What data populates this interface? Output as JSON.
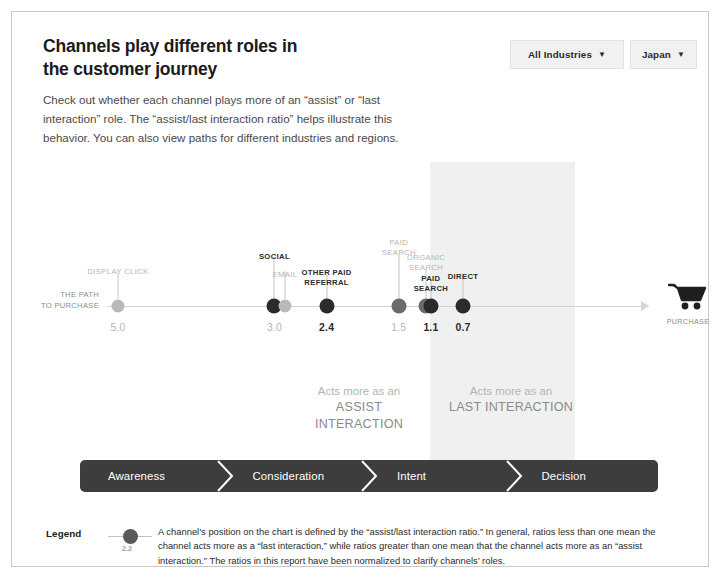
{
  "header": {
    "description": "Check out whether each channel plays more of an “assist” or “last interaction” role. The “assist/last interaction ratio” helps illustrate this behavior. You can also view paths for different industries and regions.",
    "filters": [
      {
        "name": "industry-filter",
        "label": "All Industries",
        "caret": "▼"
      },
      {
        "name": "region-filter",
        "label": "Japan",
        "caret": "▼"
      }
    ]
  },
  "axis": {
    "origin_label": "THE PATH\nTO PURCHASE",
    "end_icon": "shopping-cart-icon",
    "end_label": "PURCHASE"
  },
  "callouts": [
    {
      "name": "assist-callout",
      "line1": "Acts more as an",
      "line2": "ASSIST INTERACTION"
    },
    {
      "name": "last-callout",
      "line1": "Acts more as an",
      "line2": "LAST INTERACTION"
    }
  ],
  "funnel": {
    "stages": [
      {
        "label": "Awareness"
      },
      {
        "label": "Consideration"
      },
      {
        "label": "Intent"
      },
      {
        "label": "Decision"
      }
    ]
  },
  "legend": {
    "title": "Legend",
    "sample_value": "2.2",
    "text": "A channel’s position on the chart is defined by the “assist/last interaction ratio.” In general, ratios less than one mean the channel acts more as a “last interaction,” while ratios greater than one mean that the channel acts more as an “assist interaction.” The ratios in this report have been normalized to clarify channels’ roles."
  },
  "colors": {
    "band": "#f0f0f0",
    "funnel": "#3d3d3d",
    "axis": "#d4d4d4",
    "dot_dark": "#2b2b2b",
    "dot_mid": "#6b6b6b",
    "dot_light": "#b9b9b9"
  },
  "chart_data": {
    "type": "scatter",
    "xlabel": "assist/last interaction ratio",
    "ylabel": "",
    "xlim": [
      5.6,
      0.0
    ],
    "axis_direction": "decreasing left-to-right (path to purchase)",
    "grid": false,
    "legend_position": "bottom-left",
    "annotations": [
      "Acts more as an ASSIST INTERACTION",
      "Acts more as an LAST INTERACTION"
    ],
    "shaded_region": {
      "label": "LAST INTERACTION",
      "x_from": 1.3,
      "x_to": 0.0
    },
    "points": [
      {
        "label": "DISPLAY CLICK",
        "value": "5.0",
        "x": 5.0,
        "dot": "light",
        "label_color": "light",
        "value_color": "light",
        "stem": 26,
        "label_top": 255
      },
      {
        "label": "SOCIAL",
        "value": "3.0",
        "x": 3.05,
        "dot": "dark",
        "label_color": "dark",
        "value_color": "light",
        "stem": 42,
        "label_top": 240
      },
      {
        "label": "EMAIL",
        "value": "",
        "x": 2.92,
        "dot": "light",
        "label_color": "light",
        "value_color": "light",
        "stem": 28,
        "label_top": 258
      },
      {
        "label": "OTHER PAID\nREFERRAL",
        "value": "2.4",
        "x": 2.4,
        "dot": "dark",
        "label_color": "dark",
        "value_color": "dark",
        "stem": 24,
        "label_top": 256
      },
      {
        "label": "PAID\nSEARCH",
        "value": "1.5",
        "x": 1.5,
        "dot": "mid",
        "label_color": "light",
        "value_color": "light",
        "stem": 44,
        "label_top": 226
      },
      {
        "label": "ORGANIC\nSEARCH",
        "value": "",
        "x": 1.16,
        "dot": "mid",
        "label_color": "light",
        "value_color": "light",
        "stem": 30,
        "label_top": 241
      },
      {
        "label": "PAID\nSEARCH",
        "value": "1.1",
        "x": 1.1,
        "dot": "dark",
        "label_color": "dark",
        "value_color": "dark",
        "stem": 20,
        "label_top": 262
      },
      {
        "label": "DIRECT",
        "value": "0.7",
        "x": 0.7,
        "dot": "dark",
        "label_color": "dark",
        "value_color": "dark",
        "stem": 22,
        "label_top": 260
      }
    ]
  }
}
